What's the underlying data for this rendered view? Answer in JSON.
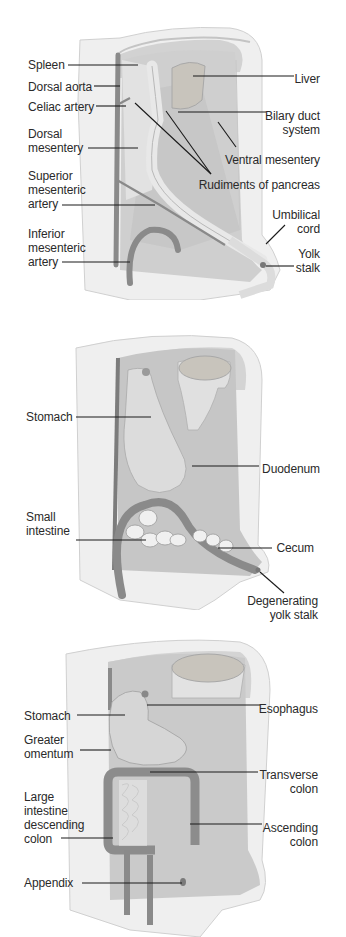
{
  "figure": {
    "panels": [
      {
        "id": "early",
        "labels": {
          "spleen": "Spleen",
          "dorsal_aorta": "Dorsal aorta",
          "celiac_artery": "Celiac artery",
          "dorsal_mesentery": "Dorsal\nmesentery",
          "superior_mesenteric_artery": "Superior\nmesenteric\nartery",
          "inferior_mesenteric_artery": "Inferior\nmesenteric\nartery",
          "liver": "Liver",
          "biliary_duct_system": "Bilary duct\nsystem",
          "ventral_mesentery": "Ventral mesentery",
          "rudiments_of_pancreas": "Rudiments of pancreas",
          "umbilical_cord": "Umbilical\ncord",
          "yolk_stalk": "Yolk\nstalk"
        }
      },
      {
        "id": "middle",
        "labels": {
          "stomach": "Stomach",
          "duodenum": "Duodenum",
          "small_intestine": "Small\nintestine",
          "cecum": "Cecum",
          "degenerating_yolk_stalk": "Degenerating\nyolk stalk"
        }
      },
      {
        "id": "late",
        "labels": {
          "stomach": "Stomach",
          "greater_omentum": "Greater\nomentum",
          "large_intestine_descending_colon": "Large\nintestine\ndescending\ncolon",
          "appendix": "Appendix",
          "esophagus": "Esophagus",
          "transverse_colon": "Transverse\ncolon",
          "ascending_colon": "Ascending\ncolon"
        }
      }
    ],
    "colors": {
      "body_wall": "#efefef",
      "body_wall_edge": "#d6d6d6",
      "cavity": "#bdbdbd",
      "organ": "#d9d9d9",
      "vessel": "#8a8a8a",
      "liver_fill": "#c8c4bc",
      "leader_line": "#1a1a1a",
      "label_text": "#2a2a2a"
    }
  }
}
